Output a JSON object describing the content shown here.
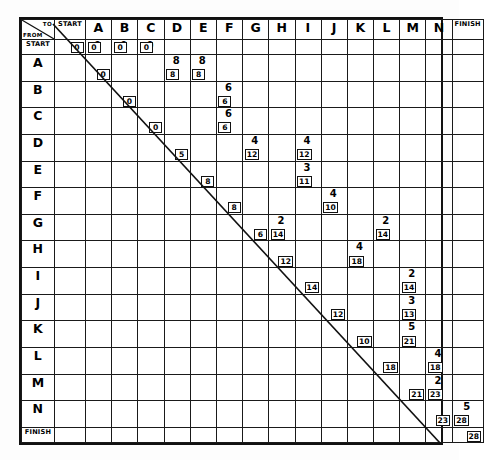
{
  "sheet": {
    "corner": {
      "to_label": "TO",
      "from_label": "FROM"
    }
  },
  "columns": [
    "START",
    "A",
    "B",
    "C",
    "D",
    "E",
    "F",
    "G",
    "H",
    "I",
    "J",
    "K",
    "L",
    "M",
    "N",
    "FINISH"
  ],
  "rows": [
    "START",
    "A",
    "B",
    "C",
    "D",
    "E",
    "F",
    "G",
    "H",
    "I",
    "J",
    "K",
    "L",
    "M",
    "N",
    "FINISH"
  ],
  "chart_data": {
    "type": "table",
    "xlabel": "TO",
    "ylabel": "FROM",
    "categories": [
      "START",
      "A",
      "B",
      "C",
      "D",
      "E",
      "F",
      "G",
      "H",
      "I",
      "J",
      "K",
      "L",
      "M",
      "N",
      "FINISH"
    ],
    "note": "Each filled cell shows a duration (upper, plain) and a cumulative value (lower, boxed). Boxed-only cells lie on the diagonal.",
    "cells": [
      {
        "row": "START",
        "col": "START",
        "top": "",
        "box": "0"
      },
      {
        "row": "START",
        "col": "A",
        "top": "0",
        "box": "0"
      },
      {
        "row": "START",
        "col": "B",
        "top": "0",
        "box": "0"
      },
      {
        "row": "START",
        "col": "C",
        "top": "0",
        "box": "0"
      },
      {
        "row": "A",
        "col": "A",
        "top": "",
        "box": "0"
      },
      {
        "row": "A",
        "col": "D",
        "top": "8",
        "box": "8"
      },
      {
        "row": "A",
        "col": "E",
        "top": "8",
        "box": "8"
      },
      {
        "row": "B",
        "col": "B",
        "top": "",
        "box": "0"
      },
      {
        "row": "B",
        "col": "F",
        "top": "6",
        "box": "6"
      },
      {
        "row": "C",
        "col": "C",
        "top": "",
        "box": "0"
      },
      {
        "row": "C",
        "col": "F",
        "top": "6",
        "box": "6"
      },
      {
        "row": "D",
        "col": "D",
        "top": "",
        "box": "5"
      },
      {
        "row": "D",
        "col": "G",
        "top": "4",
        "box": "12"
      },
      {
        "row": "D",
        "col": "I",
        "top": "4",
        "box": "12"
      },
      {
        "row": "E",
        "col": "E",
        "top": "",
        "box": "8"
      },
      {
        "row": "E",
        "col": "I",
        "top": "3",
        "box": "11"
      },
      {
        "row": "F",
        "col": "F",
        "top": "",
        "box": "8"
      },
      {
        "row": "F",
        "col": "J",
        "top": "4",
        "box": "10"
      },
      {
        "row": "G",
        "col": "G",
        "top": "",
        "box": "6"
      },
      {
        "row": "G",
        "col": "H",
        "top": "2",
        "box": "14"
      },
      {
        "row": "G",
        "col": "L",
        "top": "2",
        "box": "14"
      },
      {
        "row": "H",
        "col": "H",
        "top": "",
        "box": "12"
      },
      {
        "row": "H",
        "col": "K",
        "top": "4",
        "box": "18"
      },
      {
        "row": "I",
        "col": "I",
        "top": "",
        "box": "14"
      },
      {
        "row": "I",
        "col": "M",
        "top": "2",
        "box": "14"
      },
      {
        "row": "J",
        "col": "J",
        "top": "",
        "box": "12"
      },
      {
        "row": "J",
        "col": "M",
        "top": "3",
        "box": "13"
      },
      {
        "row": "K",
        "col": "K",
        "top": "",
        "box": "10"
      },
      {
        "row": "K",
        "col": "M",
        "top": "5",
        "box": "21"
      },
      {
        "row": "L",
        "col": "L",
        "top": "",
        "box": "18"
      },
      {
        "row": "L",
        "col": "N",
        "top": "4",
        "box": "18"
      },
      {
        "row": "M",
        "col": "M",
        "top": "",
        "box": "21"
      },
      {
        "row": "M",
        "col": "N",
        "top": "2",
        "box": "23"
      },
      {
        "row": "N",
        "col": "N",
        "top": "",
        "box": "23"
      },
      {
        "row": "N",
        "col": "FINISH",
        "top": "5",
        "box": "28"
      },
      {
        "row": "FINISH",
        "col": "FINISH",
        "top": "",
        "box": "28"
      }
    ]
  }
}
